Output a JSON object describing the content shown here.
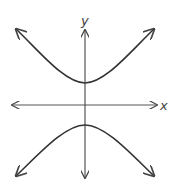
{
  "diagram": {
    "type": "hyperbola",
    "orientation": "vertical",
    "axes": {
      "x_label": "x",
      "y_label": "y"
    },
    "colors": {
      "axis": "#555555",
      "curve": "#333333",
      "background": "#ffffff"
    }
  }
}
